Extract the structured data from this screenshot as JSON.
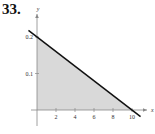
{
  "problem_number": "33.",
  "chart_data": {
    "type": "area",
    "title": "",
    "xlabel": "x",
    "ylabel": "y",
    "xlim": [
      0,
      11
    ],
    "ylim": [
      0,
      0.23
    ],
    "x_ticks": [
      2,
      4,
      6,
      8,
      10
    ],
    "x_tick_labels": [
      "2",
      "4",
      "6",
      "8",
      "10"
    ],
    "y_ticks": [
      0.1,
      0.2
    ],
    "y_tick_labels": [
      "0.1",
      "0.2"
    ],
    "grid": false,
    "legend": "none",
    "series": [
      {
        "name": "line",
        "x": [
          0,
          10
        ],
        "y": [
          0.2,
          0
        ],
        "equation": "y = 0.2 - 0.02x"
      }
    ],
    "shaded_region": {
      "vertices": [
        [
          0,
          0
        ],
        [
          0,
          0.2
        ],
        [
          10,
          0
        ]
      ],
      "fill_color": "#d9d9d9"
    },
    "line_color": "#111111",
    "axis_color": "#888888"
  }
}
